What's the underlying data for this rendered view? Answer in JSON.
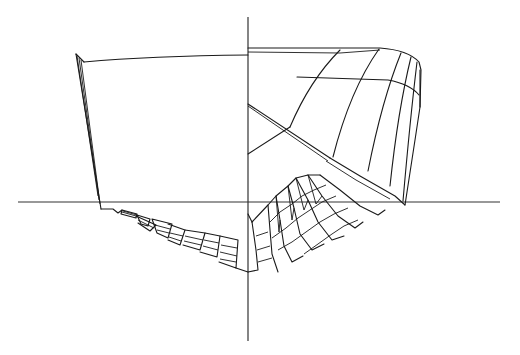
{
  "figure": {
    "type": "ship hull body plan wireframe",
    "stroke_color": "#1a1a1a",
    "axis_color": "#333333",
    "background": "#ffffff",
    "axes": {
      "centerline": {
        "x": 248,
        "y1": 17,
        "y2": 341
      },
      "baseline": {
        "y": 202,
        "x1": 18,
        "x2": 500
      }
    },
    "left_half": {
      "label": "aft body sections",
      "transom_outline": [
        [
          76,
          54
        ],
        [
          84,
          62
        ],
        [
          101,
          209
        ]
      ],
      "deck_line": [
        [
          84,
          62
        ],
        [
          150,
          58
        ],
        [
          200,
          56
        ],
        [
          248,
          55
        ]
      ]
    },
    "right_half": {
      "label": "fore body sections",
      "deck_line": [
        [
          248,
          48
        ],
        [
          380,
          48
        ],
        [
          408,
          52
        ],
        [
          419,
          62
        ],
        [
          421,
          70
        ],
        [
          420,
          107
        ]
      ]
    }
  }
}
